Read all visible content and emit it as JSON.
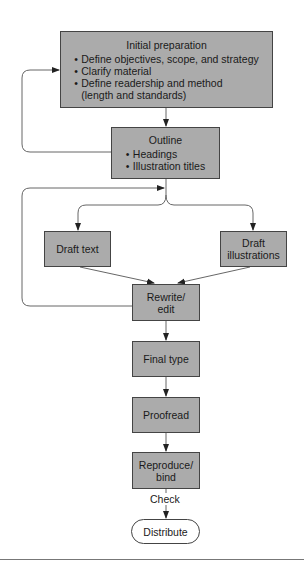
{
  "diagram": {
    "type": "flowchart",
    "colors": {
      "box_fill": "#ababab",
      "border": "#444444",
      "line": "#555555",
      "terminal_fill": "#ffffff"
    },
    "nodes": {
      "initial": {
        "title": "Initial preparation",
        "bullets": [
          "Define objectives, scope, and strategy",
          "Clarify material",
          "Define readership and method"
        ],
        "continuation": "(length and standards)"
      },
      "outline": {
        "title": "Outline",
        "bullets": [
          "Headings",
          "Illustration titles"
        ]
      },
      "draft_text": {
        "label": "Draft text"
      },
      "draft_illustrations": {
        "line1": "Draft",
        "line2": "illustrations"
      },
      "rewrite": {
        "line1": "Rewrite/",
        "line2": "edit"
      },
      "final_type": {
        "label": "Final type"
      },
      "proofread": {
        "label": "Proofread"
      },
      "reproduce": {
        "line1": "Reproduce/",
        "line2": "bind"
      },
      "distribute": {
        "label": "Distribute"
      }
    },
    "edge_labels": {
      "check": "Check"
    },
    "edges": [
      [
        "initial",
        "outline"
      ],
      [
        "outline",
        "initial",
        "feedback loop"
      ],
      [
        "outline",
        "draft_text"
      ],
      [
        "outline",
        "draft_illustrations"
      ],
      [
        "draft_text",
        "rewrite"
      ],
      [
        "draft_illustrations",
        "rewrite"
      ],
      [
        "rewrite",
        "outline",
        "feedback loop"
      ],
      [
        "rewrite",
        "final_type"
      ],
      [
        "final_type",
        "proofread"
      ],
      [
        "proofread",
        "reproduce"
      ],
      [
        "reproduce",
        "distribute",
        "Check"
      ]
    ]
  }
}
